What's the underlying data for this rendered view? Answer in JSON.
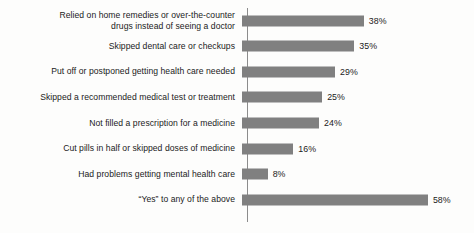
{
  "chart_data": {
    "type": "bar",
    "orientation": "horizontal",
    "title": "",
    "subtitle": "",
    "xlabel": "",
    "ylabel": "",
    "xlim": [
      0,
      70
    ],
    "grid": false,
    "legend": null,
    "value_suffix": "%",
    "categories": [
      "Relied on home remedies or over-the-counter\ndrugs instead of seeing a doctor",
      "Skipped dental care or checkups",
      "Put off or postponed getting health care needed",
      "Skipped a recommended medical test or treatment",
      "Not filled a prescription for a medicine",
      "Cut pills in half or skipped doses of medicine",
      "Had problems getting mental health care",
      "“Yes” to any of the above"
    ],
    "values": [
      38,
      35,
      29,
      25,
      24,
      16,
      8,
      58
    ],
    "value_labels": [
      "38%",
      "35%",
      "29%",
      "25%",
      "24%",
      "16%",
      "8%",
      "58%"
    ],
    "bar_color": "#808080",
    "axis_color": "#8c8c8c",
    "text_color": "#1b1b1b",
    "background_color": "#fdfdfc"
  }
}
